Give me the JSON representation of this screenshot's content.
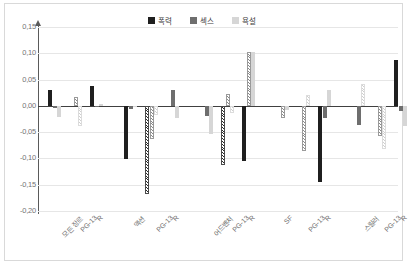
{
  "chart_data": {
    "type": "bar",
    "title": "",
    "xlabel": "",
    "ylabel": "",
    "ylim": [
      -0.2,
      0.15
    ],
    "grid": true,
    "legend_position": "top-center",
    "y_ticks": [
      "0,15",
      "0,10",
      "0,05",
      "0,00",
      "-0,05",
      "-0,10",
      "-0,15",
      "-0,20"
    ],
    "y_tick_values": [
      0.15,
      0.1,
      0.05,
      0.0,
      -0.05,
      -0.1,
      -0.15,
      -0.2
    ],
    "groups": [
      "모든 장르",
      "액션",
      "어드벤처",
      "SF",
      "스릴러"
    ],
    "categories": [
      "모든 장르",
      "PG-13",
      "R",
      "액션",
      "PG-13",
      "R",
      "어드벤처",
      "PG-13",
      "R",
      "SF",
      "PG-13",
      "R",
      "스릴러",
      "PG-13",
      "R"
    ],
    "series": [
      {
        "name": "폭력",
        "color": "#1f1f1f",
        "values": [
          0.03,
          0.0,
          0.038,
          -0.102,
          -0.167,
          0.0,
          0.0,
          -0.113,
          -0.105,
          0.0,
          0.0,
          -0.145,
          0.0,
          0.0,
          0.087
        ]
      },
      {
        "name": "섹스",
        "color": "#6e6e6e",
        "values": [
          -0.004,
          0.017,
          -0.003,
          -0.006,
          -0.063,
          0.03,
          -0.019,
          0.023,
          0.103,
          -0.024,
          -0.085,
          -0.023,
          -0.037,
          -0.058,
          -0.01
        ]
      },
      {
        "name": "욕설",
        "color": "#d6d6d6",
        "values": [
          -0.021,
          -0.038,
          0.004,
          -0.003,
          -0.018,
          -0.023,
          -0.053,
          -0.013,
          0.102,
          -0.008,
          0.021,
          0.03,
          0.041,
          -0.082,
          -0.038
        ]
      }
    ]
  },
  "legend": {
    "items": [
      {
        "label": "폭력"
      },
      {
        "label": "섹스"
      },
      {
        "label": "욕설"
      }
    ]
  }
}
